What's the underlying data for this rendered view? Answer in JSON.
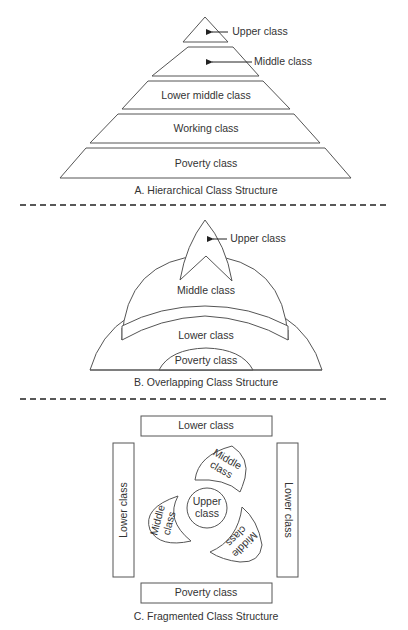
{
  "section_a": {
    "caption": "A. Hierarchical Class Structure",
    "tiers": [
      {
        "label": "Upper class"
      },
      {
        "label": "Middle class"
      },
      {
        "label": "Lower middle class"
      },
      {
        "label": "Working class"
      },
      {
        "label": "Poverty class"
      }
    ]
  },
  "section_b": {
    "caption": "B. Overlapping Class Structure",
    "labels": {
      "upper": "Upper class",
      "middle": "Middle class",
      "lower": "Lower class",
      "poverty": "Poverty class"
    }
  },
  "section_c": {
    "caption": "C. Fragmented Class Structure",
    "labels": {
      "top_box": "Lower class",
      "left_box": "Lower class",
      "right_box": "Lower class",
      "bottom_box": "Poverty class",
      "center_line1": "Upper",
      "center_line2": "class",
      "middle_line1": "Middle",
      "middle_line2": "class"
    }
  }
}
